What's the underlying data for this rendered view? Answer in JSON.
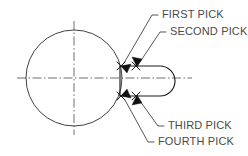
{
  "drawing": {
    "title": "Pick Order Diagram",
    "canvas": {
      "width": 248,
      "height": 156,
      "background": "#ffffff"
    },
    "colors": {
      "object_line": "#1a1a1a",
      "circle_line": "#2b2b2b",
      "center_line": "#3d3d3d",
      "leader_line": "#2b2b2b",
      "label_text": "#4a4a4a",
      "arrow_fill": "#111111"
    },
    "shapes": {
      "circle": {
        "name": "circle",
        "center_x": 74,
        "center_y": 78,
        "radius": 48
      },
      "slot": {
        "name": "slot",
        "left_x": 120,
        "right_x": 175,
        "top_y": 66,
        "bottom_y": 96,
        "corner_radius": 15
      },
      "centerlines": {
        "horizontal": {
          "x1": 17,
          "y1": 78,
          "x2": 192,
          "y2": 78
        },
        "vertical": {
          "x1": 74,
          "y1": 21,
          "x2": 74,
          "y2": 135
        }
      }
    },
    "picks": [
      {
        "id": "first-pick",
        "label": "FIRST PICK",
        "marker": "arrow",
        "target_x": 121,
        "target_y": 66,
        "label_x": 162,
        "label_y": 18,
        "leader": "M 158 15 L 152 15 L 124 63"
      },
      {
        "id": "second-pick",
        "label": "SECOND PICK",
        "marker": "x-cross",
        "target_x": 136,
        "target_y": 66,
        "label_x": 170,
        "label_y": 35,
        "leader": "M 166 32 L 160 32 L 140 62"
      },
      {
        "id": "third-pick",
        "label": "THIRD PICK",
        "marker": "x-cross",
        "target_x": 136,
        "target_y": 96,
        "label_x": 168,
        "label_y": 129,
        "leader": "M 164 126 L 158 126 L 140 101"
      },
      {
        "id": "fourth-pick",
        "label": "FOURTH PICK",
        "marker": "arrow",
        "target_x": 121,
        "target_y": 96,
        "label_x": 158,
        "label_y": 145,
        "leader": "M 154 142 L 148 142 L 125 100"
      }
    ],
    "pick_order_note": "Four sequential selection points on the slot geometry"
  }
}
